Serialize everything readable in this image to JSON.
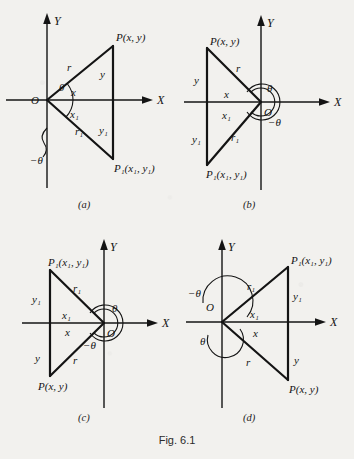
{
  "figure": {
    "caption": "Fig. 6.1",
    "axis_labels": {
      "x": "X",
      "y": "Y"
    },
    "panels": [
      {
        "id": "a",
        "caption": "(a)",
        "origin_label": "O",
        "labels": {
          "point_p": "P(x, y)",
          "point_p1": "P₁(x₁, y₁)",
          "r": "r",
          "r1": "r₁",
          "x": "x",
          "x1": "x₁",
          "y": "y",
          "y1": "y₁",
          "theta": "θ",
          "neg_theta": "−θ"
        }
      },
      {
        "id": "b",
        "caption": "(b)",
        "origin_label": "O",
        "labels": {
          "point_p": "P(x, y)",
          "point_p1": "P₁(x₁, y₁)",
          "r": "r",
          "r1": "r₁",
          "x": "x",
          "x1": "x₁",
          "y": "y",
          "y1": "y₁",
          "theta": "θ",
          "neg_theta": "−θ"
        }
      },
      {
        "id": "c",
        "caption": "(c)",
        "origin_label": "O",
        "labels": {
          "point_p": "P(x, y)",
          "point_p1": "P₁(x₁, y₁)",
          "r": "r",
          "r1": "r₁",
          "x": "x",
          "x1": "x₁",
          "y": "y",
          "y1": "y₁",
          "theta": "θ",
          "neg_theta": "−θ"
        }
      },
      {
        "id": "d",
        "caption": "(d)",
        "origin_label": "O",
        "labels": {
          "point_p": "P(x, y)",
          "point_p1": "P₁(x₁, y₁)",
          "r": "r",
          "r1": "r₁",
          "x": "x",
          "x1": "x₁",
          "y": "y",
          "y1": "y₁",
          "theta": "θ",
          "neg_theta": "−θ"
        }
      }
    ]
  }
}
